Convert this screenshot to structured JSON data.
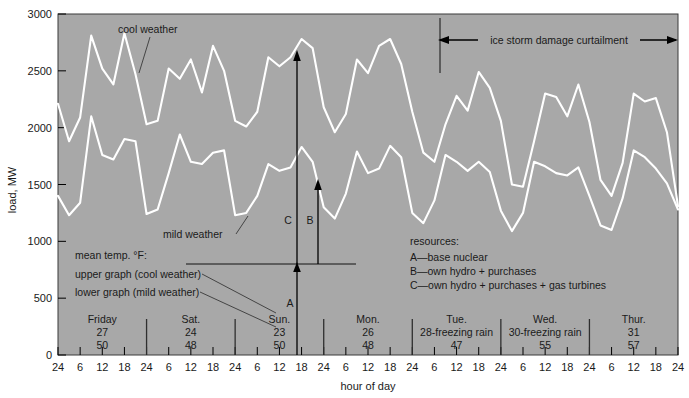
{
  "chart_data": {
    "type": "line",
    "title": "",
    "xlabel": "hour of day",
    "ylabel": "load, MW",
    "ylim": [
      0,
      3000
    ],
    "ytick_labels": [
      "0",
      "500",
      "1000",
      "1500",
      "2000",
      "2500",
      "3000"
    ],
    "ytick_values": [
      0,
      500,
      1000,
      1500,
      2000,
      2500,
      3000
    ],
    "xlim": [
      0,
      168
    ],
    "xtick_labels": [
      "24",
      "6",
      "12",
      "18",
      "24",
      "6",
      "12",
      "18",
      "24",
      "6",
      "12",
      "18",
      "24",
      "6",
      "12",
      "18",
      "24",
      "6",
      "12",
      "18",
      "24",
      "6",
      "12",
      "18",
      "24",
      "6",
      "12",
      "18",
      "24"
    ],
    "grid": false,
    "legend_position": "inline-annotations",
    "plot_background": "#a8a8a8",
    "curve_color": "#ffffff",
    "series": [
      {
        "name": "cool weather",
        "label_text": "cool weather",
        "x": [
          0,
          3,
          6,
          9,
          12,
          15,
          18,
          21,
          24,
          27,
          30,
          33,
          36,
          39,
          42,
          45,
          48,
          51,
          54,
          57,
          60,
          63,
          66,
          69,
          72,
          75,
          78,
          81,
          84,
          87,
          90,
          93,
          96,
          99,
          102,
          105,
          108,
          111,
          114,
          117,
          120,
          123,
          126,
          129,
          132,
          135,
          138,
          141,
          144,
          147,
          150,
          153,
          156,
          159,
          162,
          165,
          168
        ],
        "values": [
          2210,
          1880,
          2090,
          2810,
          2520,
          2380,
          2830,
          2470,
          2030,
          2060,
          2520,
          2430,
          2600,
          2310,
          2720,
          2500,
          2060,
          2010,
          2140,
          2620,
          2540,
          2620,
          2780,
          2700,
          2180,
          1960,
          2120,
          2600,
          2480,
          2720,
          2780,
          2560,
          2140,
          1780,
          1700,
          2030,
          2280,
          2150,
          2490,
          2350,
          2060,
          1500,
          1480,
          1880,
          2300,
          2270,
          2100,
          2380,
          2050,
          1540,
          1400,
          1690,
          2300,
          2230,
          2260,
          1960,
          1310
        ]
      },
      {
        "name": "mild weather",
        "label_text": "mild weather",
        "x": [
          0,
          3,
          6,
          9,
          12,
          15,
          18,
          21,
          24,
          27,
          30,
          33,
          36,
          39,
          42,
          45,
          48,
          51,
          54,
          57,
          60,
          63,
          66,
          69,
          72,
          75,
          78,
          81,
          84,
          87,
          90,
          93,
          96,
          99,
          102,
          105,
          108,
          111,
          114,
          117,
          120,
          123,
          126,
          129,
          132,
          135,
          138,
          141,
          144,
          147,
          150,
          153,
          156,
          159,
          162,
          165,
          168
        ],
        "values": [
          1400,
          1230,
          1340,
          2100,
          1760,
          1720,
          1900,
          1880,
          1240,
          1280,
          1600,
          1940,
          1700,
          1680,
          1780,
          1800,
          1230,
          1250,
          1400,
          1680,
          1620,
          1650,
          1830,
          1700,
          1300,
          1200,
          1420,
          1790,
          1600,
          1640,
          1840,
          1740,
          1250,
          1160,
          1360,
          1760,
          1700,
          1620,
          1700,
          1610,
          1270,
          1090,
          1250,
          1700,
          1660,
          1600,
          1580,
          1650,
          1400,
          1140,
          1100,
          1380,
          1800,
          1740,
          1640,
          1510,
          1280
        ]
      }
    ],
    "days": [
      {
        "name": "Friday",
        "cool_temp": "27",
        "mild_temp": "50",
        "note": ""
      },
      {
        "name": "Sat.",
        "cool_temp": "24",
        "mild_temp": "48",
        "note": ""
      },
      {
        "name": "Sun.",
        "cool_temp": "23",
        "mild_temp": "50",
        "note": ""
      },
      {
        "name": "Mon.",
        "cool_temp": "26",
        "mild_temp": "48",
        "note": ""
      },
      {
        "name": "Tue.",
        "cool_temp": "28-freezing rain",
        "mild_temp": "47",
        "note": "freezing rain"
      },
      {
        "name": "Wed.",
        "cool_temp": "30-freezing rain",
        "mild_temp": "55",
        "note": "freezing rain"
      },
      {
        "name": "Thur.",
        "cool_temp": "31",
        "mild_temp": "57",
        "note": ""
      }
    ],
    "annotations": {
      "temp_legend": {
        "line1": "mean temp. °F:",
        "line2": "upper graph (cool weather)",
        "line3": "lower graph (mild weather)"
      },
      "resources": {
        "title": "resources:",
        "items": [
          "A—base nuclear",
          "B—own hydro + purchases",
          "C—own hydro + purchases + gas turbines"
        ]
      },
      "arrows": {
        "a_label": "A",
        "b_label": "B",
        "c_label": "C",
        "a_from": 0,
        "a_to": 800,
        "b_from": 800,
        "b_to": 1830,
        "c_from": 800,
        "c_to": 2745
      },
      "ice_storm": {
        "label": "ice storm damage curtailment",
        "x_start_hour": 96,
        "x_end_hour": 168
      }
    }
  }
}
